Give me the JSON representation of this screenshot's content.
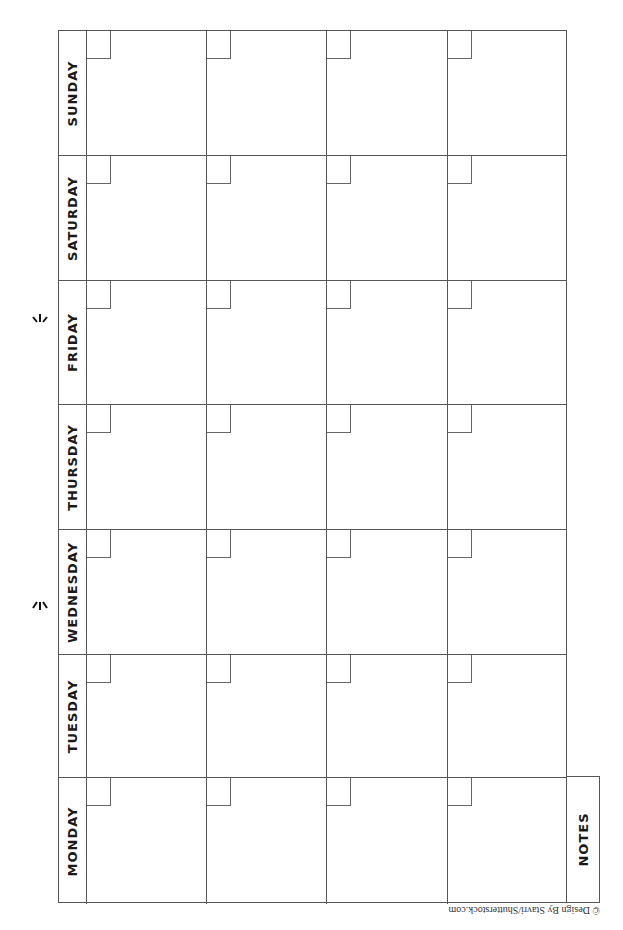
{
  "document": {
    "type": "monthly-calendar-template",
    "orientation": "rotated-landscape",
    "days": [
      {
        "label": "SUNDAY"
      },
      {
        "label": "SATURDAY"
      },
      {
        "label": "FRIDAY"
      },
      {
        "label": "THURSDAY"
      },
      {
        "label": "WEDNESDAY"
      },
      {
        "label": "TUESDAY"
      },
      {
        "label": "MONDAY"
      }
    ],
    "weeks_per_day": 4,
    "notes_label": "NOTES",
    "copyright": "© Design By Stavri/Shutterstock.com",
    "colors": {
      "line": "#555555",
      "text": "#1a1a1a",
      "background": "#ffffff"
    }
  }
}
